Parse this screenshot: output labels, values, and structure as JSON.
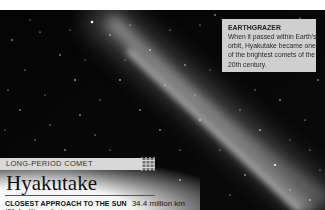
{
  "infobox": {
    "title": "EARTHGRAZER",
    "body": "When it passed within Earth's orbit, Hyakutake became one of the brightest comets of the 20th century."
  },
  "comet": {
    "category": "LONG-PERIOD COMET",
    "name": "Hyakutake",
    "facts": [
      {
        "label": "CLOSEST APPROACH TO THE SUN",
        "value": "34.4 million km",
        "sub": "(21.4 million miles)"
      }
    ]
  },
  "colors": {
    "sky": "#070707",
    "infobox_bg": "#cfcfcf",
    "label_bar_bg": "#d8d8d8",
    "text_dark": "#111111"
  }
}
